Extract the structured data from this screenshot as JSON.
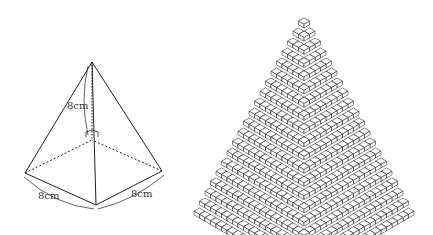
{
  "left_figure": {
    "description": "Square pyramid with height and base edge labels",
    "labels": {
      "height": "8cm",
      "base_left": "8cm",
      "base_right": "8cm"
    },
    "points": {
      "apex": [
        92,
        62
      ],
      "left": [
        25,
        173
      ],
      "front": [
        96,
        205
      ],
      "right": [
        162,
        171
      ],
      "back": [
        92,
        140
      ]
    }
  },
  "right_figure": {
    "description": "Stepped pyramid made of unit cubes",
    "layers": 20,
    "apex": [
      304,
      18
    ],
    "cube_half_width": 5.5,
    "cube_rise": 3.2,
    "cube_height": 3.6
  },
  "colors": {
    "line": "#222222",
    "face_top": "#ffffff",
    "face_left": "#ffffff",
    "face_right": "#ffffff"
  }
}
